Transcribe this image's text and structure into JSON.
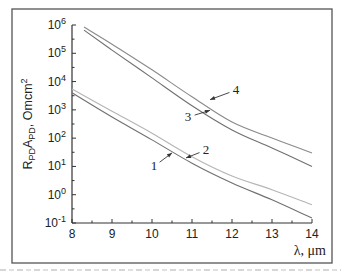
{
  "chart_data": {
    "type": "line",
    "title": "",
    "xlabel": "λ, μm",
    "ylabel": "R_PD·A_PD, Omcm²",
    "ylabel_parts": {
      "main1": "R",
      "sub1": "PD",
      "main2": "A",
      "sub2": "PD",
      "rest": ", Omcm",
      "sup": "2"
    },
    "xlim": [
      8,
      14
    ],
    "ylim": [
      0.1,
      1000000
    ],
    "yscale": "log",
    "grid": false,
    "x_ticks": [
      8,
      9,
      10,
      11,
      12,
      13,
      14
    ],
    "x_tick_labels": [
      "8",
      "9",
      "10",
      "11",
      "12",
      "13",
      "14"
    ],
    "y_ticks": [
      {
        "value": 1000000,
        "base": "10",
        "exp": "6"
      },
      {
        "value": 100000,
        "base": "10",
        "exp": "5"
      },
      {
        "value": 10000,
        "base": "10",
        "exp": "4"
      },
      {
        "value": 1000,
        "base": "10",
        "exp": "3"
      },
      {
        "value": 100,
        "base": "10",
        "exp": "2"
      },
      {
        "value": 10,
        "base": "10",
        "exp": "1"
      },
      {
        "value": 1,
        "base": "10",
        "exp": "0"
      },
      {
        "value": 0.1,
        "base": "10",
        "exp": "-1"
      }
    ],
    "series": [
      {
        "name": "1",
        "color": "#707070",
        "x": [
          8,
          9,
          10,
          11,
          12,
          13,
          14
        ],
        "values": [
          4000,
          560,
          87,
          13,
          2.6,
          0.66,
          0.15
        ]
      },
      {
        "name": "2",
        "color": "#b5b5b5",
        "x": [
          8,
          9,
          10,
          11,
          12,
          13,
          14
        ],
        "values": [
          5500,
          900,
          150,
          22,
          4.6,
          1.5,
          0.44
        ]
      },
      {
        "name": "3",
        "color": "#707070",
        "x": [
          8.3,
          9,
          10,
          11,
          12,
          13,
          14
        ],
        "values": [
          660000,
          130000,
          13500,
          1400,
          195,
          45,
          10
        ]
      },
      {
        "name": "4",
        "color": "#8a8a8a",
        "x": [
          8.3,
          9,
          10,
          11,
          12,
          13,
          14
        ],
        "values": [
          850000,
          210000,
          26000,
          2900,
          370,
          100,
          30
        ]
      }
    ],
    "annotations": [
      {
        "label": "1",
        "text_x": 10.05,
        "text_y": 10,
        "arrow_to_x": 10.5,
        "arrow_to_y": 30
      },
      {
        "label": "2",
        "text_x": 11.35,
        "text_y": 38,
        "arrow_to_x": 10.85,
        "arrow_to_y": 20
      },
      {
        "label": "3",
        "text_x": 10.9,
        "text_y": 550,
        "arrow_to_x": 11.45,
        "arrow_to_y": 960
      },
      {
        "label": "4",
        "text_x": 12.1,
        "text_y": 5000,
        "arrow_to_x": 11.45,
        "arrow_to_y": 2300
      }
    ]
  }
}
